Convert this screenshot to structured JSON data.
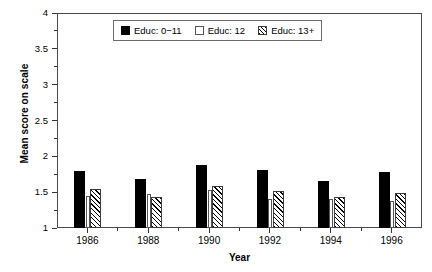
{
  "chart_data": {
    "type": "bar",
    "title": "",
    "xlabel": "Year",
    "ylabel": "Mean score on scale",
    "categories": [
      "1986",
      "1988",
      "1990",
      "1992",
      "1994",
      "1996"
    ],
    "series": [
      {
        "name": "Educ: 0−11",
        "values": [
          1.79,
          1.69,
          1.88,
          1.81,
          1.65,
          1.78
        ]
      },
      {
        "name": "Educ: 12",
        "values": [
          1.45,
          1.47,
          1.53,
          1.41,
          1.4,
          1.38
        ]
      },
      {
        "name": "Educ: 13+",
        "values": [
          1.54,
          1.43,
          1.58,
          1.52,
          1.43,
          1.49
        ]
      }
    ],
    "ylim": [
      1,
      4
    ],
    "yticks": [
      "1",
      "1.5",
      "2",
      "2.5",
      "3",
      "3.5",
      "4"
    ],
    "ytick_values": [
      1,
      1.5,
      2,
      2.5,
      3,
      3.5,
      4
    ],
    "yminor_values": [
      1.25,
      1.75,
      2.25,
      2.75,
      3.25,
      3.75
    ],
    "grid": false,
    "legend_position": "top-center",
    "baseline": 1
  },
  "legend": {
    "entries": [
      {
        "label": "Educ: 0−11",
        "swatch": "solid-black-swatch"
      },
      {
        "label": "Educ: 12",
        "swatch": "open-white-swatch"
      },
      {
        "label": "Educ: 13+",
        "swatch": "hatched-swatch"
      }
    ]
  }
}
